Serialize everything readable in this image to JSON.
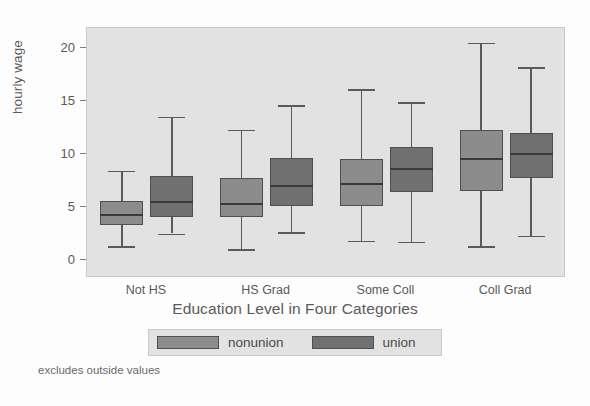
{
  "chart_data": {
    "type": "box",
    "title": "",
    "xlabel": "Education Level in Four Categories",
    "ylabel": "hourly wage",
    "footnote": "excludes outside values",
    "ylim": [
      0,
      21.5
    ],
    "yticks": [
      0,
      5,
      10,
      15,
      20
    ],
    "ytick_labels": [
      "0",
      "5",
      "10",
      "15",
      "20"
    ],
    "grid": false,
    "legend_position": "bottom",
    "categories": [
      "Not HS",
      "HS Grad",
      "Some Coll",
      "Coll Grad"
    ],
    "legend": [
      {
        "name": "nonunion",
        "color": "#8c8c8c"
      },
      {
        "name": "union",
        "color": "#707070"
      }
    ],
    "series": [
      {
        "name": "nonunion",
        "color": "#8c8c8c",
        "boxes": [
          {
            "category": "Not HS",
            "whisker_low": 1.3,
            "q1": 3.3,
            "median": 4.3,
            "q3": 5.6,
            "whisker_high": 8.4
          },
          {
            "category": "HS Grad",
            "whisker_low": 1.0,
            "q1": 4.1,
            "median": 5.4,
            "q3": 7.7,
            "whisker_high": 12.3
          },
          {
            "category": "Some Coll",
            "whisker_low": 1.8,
            "q1": 5.1,
            "median": 7.3,
            "q3": 9.5,
            "whisker_high": 16.1
          },
          {
            "category": "Coll Grad",
            "whisker_low": 1.3,
            "q1": 6.5,
            "median": 9.6,
            "q3": 12.3,
            "whisker_high": 20.5
          }
        ]
      },
      {
        "name": "union",
        "color": "#707070",
        "boxes": [
          {
            "category": "Not HS",
            "whisker_low": 2.5,
            "q1": 4.1,
            "median": 5.6,
            "q3": 7.9,
            "whisker_high": 13.5
          },
          {
            "category": "HS Grad",
            "whisker_low": 2.6,
            "q1": 5.1,
            "median": 7.1,
            "q3": 9.6,
            "whisker_high": 14.6
          },
          {
            "category": "Some Coll",
            "whisker_low": 1.7,
            "q1": 6.4,
            "median": 8.7,
            "q3": 10.7,
            "whisker_high": 14.9
          },
          {
            "category": "Coll Grad",
            "whisker_low": 2.3,
            "q1": 7.7,
            "median": 10.1,
            "q3": 12.0,
            "whisker_high": 18.2
          }
        ]
      }
    ]
  },
  "axis": {
    "y_title": "hourly wage",
    "x_title": "Education Level in Four Categories"
  },
  "legend": {
    "nonunion_label": "nonunion",
    "union_label": "union"
  },
  "note": {
    "text": "excludes outside values"
  }
}
